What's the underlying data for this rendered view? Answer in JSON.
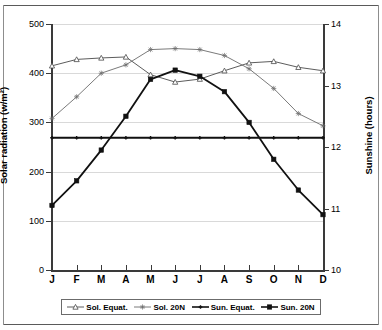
{
  "chart_data": {
    "type": "line",
    "title": "",
    "xlabel": "",
    "ylabel": "Solar radiation (w/m²)",
    "y2label": "Sunshine (hours)",
    "categories": [
      "J",
      "F",
      "M",
      "A",
      "M",
      "J",
      "J",
      "A",
      "S",
      "O",
      "N",
      "D"
    ],
    "ylim": [
      0,
      500
    ],
    "yticks": [
      0,
      100,
      200,
      300,
      400,
      500
    ],
    "y2lim": [
      10,
      14
    ],
    "y2ticks": [
      10,
      11,
      12,
      13,
      14
    ],
    "grid": true,
    "legend_position": "bottom",
    "series": [
      {
        "name": "Sol. Equat.",
        "axis": "left",
        "unit": "w/m²",
        "marker": "open-triangle",
        "color": "#4a4a4a",
        "values": [
          415,
          428,
          431,
          433,
          397,
          382,
          388,
          405,
          421,
          424,
          412,
          405
        ]
      },
      {
        "name": "Sol. 20N",
        "axis": "left",
        "unit": "w/m²",
        "marker": "asterisk",
        "color": "#6b6b6b",
        "values": [
          308,
          352,
          400,
          417,
          448,
          450,
          448,
          436,
          409,
          369,
          318,
          293
        ]
      },
      {
        "name": "Sun. Equat.",
        "axis": "right",
        "unit": "hours",
        "marker": "small-cross",
        "color": "#111111",
        "values": [
          12.15,
          12.15,
          12.15,
          12.15,
          12.15,
          12.15,
          12.15,
          12.15,
          12.15,
          12.15,
          12.15,
          12.15
        ]
      },
      {
        "name": "Sun. 20N",
        "axis": "right",
        "unit": "hours",
        "marker": "filled-square",
        "color": "#111111",
        "values": [
          11.05,
          11.45,
          11.95,
          12.5,
          13.1,
          13.25,
          13.15,
          12.9,
          12.4,
          11.8,
          11.3,
          10.9
        ]
      }
    ]
  },
  "axes": {
    "left": {
      "title": "Solar radiation (w/m²)",
      "labels": [
        "500",
        "400",
        "300",
        "200",
        "100",
        "0"
      ]
    },
    "right": {
      "title": "Sunshine (hours)",
      "labels": [
        "14",
        "13",
        "12",
        "11",
        "10"
      ]
    },
    "x": {
      "labels": [
        "J",
        "F",
        "M",
        "A",
        "M",
        "J",
        "J",
        "A",
        "S",
        "O",
        "N",
        "D"
      ]
    }
  },
  "legend": {
    "items": [
      {
        "label": "Sol. Equat.",
        "marker": "open-triangle",
        "color": "#4a4a4a"
      },
      {
        "label": "Sol. 20N",
        "marker": "asterisk",
        "color": "#6b6b6b"
      },
      {
        "label": "Sun. Equat.",
        "marker": "small-cross",
        "color": "#111111"
      },
      {
        "label": "Sun. 20N",
        "marker": "filled-square",
        "color": "#111111"
      }
    ]
  }
}
